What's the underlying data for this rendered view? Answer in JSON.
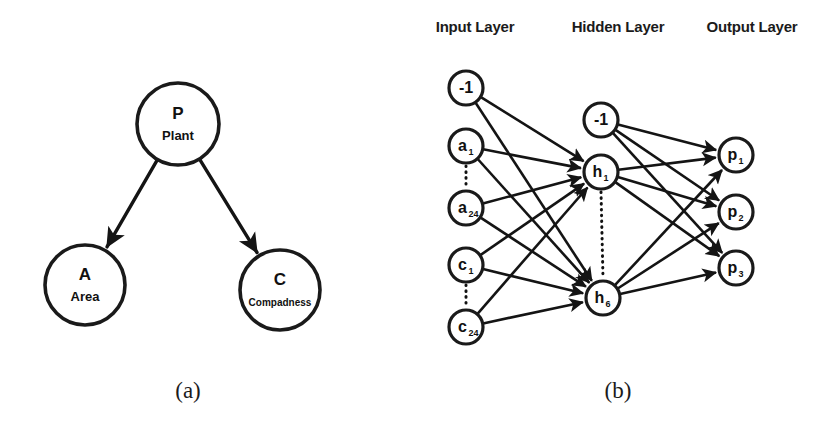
{
  "figure": {
    "background_color": "#ffffff",
    "ink_color": "#141414",
    "panels": [
      {
        "id": "panel-a",
        "caption": "(a)",
        "type": "bayesian-network-diagram",
        "nodes": [
          {
            "id": "P",
            "label": "P",
            "sublabel": "Plant",
            "cx": 178,
            "cy": 124,
            "r": 41
          },
          {
            "id": "A",
            "label": "A",
            "sublabel": "Area",
            "cx": 85,
            "cy": 285,
            "r": 40
          },
          {
            "id": "C",
            "label": "C",
            "sublabel": "Compadness",
            "cx": 280,
            "cy": 290,
            "r": 40
          }
        ],
        "edges": [
          {
            "from": "P",
            "to": "A",
            "arrow": true
          },
          {
            "from": "P",
            "to": "C",
            "arrow": true
          }
        ]
      },
      {
        "id": "panel-b",
        "caption": "(b)",
        "type": "neural-network-diagram",
        "layer_labels": [
          {
            "text": "Input Layer",
            "x": 475,
            "y": 32
          },
          {
            "text": "Hidden Layer",
            "x": 618,
            "y": 32
          },
          {
            "text": "Output Layer",
            "x": 752,
            "y": 32
          }
        ],
        "layers": [
          {
            "name": "input",
            "nodes": [
              {
                "id": "in-bias",
                "label": "-1",
                "sub": "",
                "cx": 466,
                "cy": 88,
                "r": 17
              },
              {
                "id": "a1",
                "label": "a",
                "sub": "1",
                "cx": 466,
                "cy": 146,
                "r": 17
              },
              {
                "id": "a24",
                "label": "a",
                "sub": "24",
                "cx": 466,
                "cy": 208,
                "r": 17
              },
              {
                "id": "c1",
                "label": "c",
                "sub": "1",
                "cx": 466,
                "cy": 265,
                "r": 17
              },
              {
                "id": "c24",
                "label": "c",
                "sub": "24",
                "cx": 466,
                "cy": 327,
                "r": 17
              }
            ],
            "ellipses": [
              {
                "from": "a1",
                "to": "a24"
              },
              {
                "from": "c1",
                "to": "c24"
              }
            ]
          },
          {
            "name": "hidden",
            "nodes": [
              {
                "id": "hid-bias",
                "label": "-1",
                "sub": "",
                "cx": 601,
                "cy": 120,
                "r": 17
              },
              {
                "id": "h1",
                "label": "h",
                "sub": "1",
                "cx": 601,
                "cy": 172,
                "r": 17
              },
              {
                "id": "h6",
                "label": "h",
                "sub": "6",
                "cx": 603,
                "cy": 298,
                "r": 17
              }
            ],
            "ellipses": [
              {
                "from": "h1",
                "to": "h6"
              }
            ]
          },
          {
            "name": "output",
            "nodes": [
              {
                "id": "p1",
                "label": "p",
                "sub": "1",
                "cx": 736,
                "cy": 155,
                "r": 17
              },
              {
                "id": "p2",
                "label": "p",
                "sub": "2",
                "cx": 736,
                "cy": 212,
                "r": 17
              },
              {
                "id": "p3",
                "label": "p",
                "sub": "3",
                "cx": 736,
                "cy": 268,
                "r": 17
              }
            ],
            "ellipses": []
          }
        ],
        "edges": [
          {
            "from": "in-bias",
            "to": "h1"
          },
          {
            "from": "in-bias",
            "to": "h6"
          },
          {
            "from": "a1",
            "to": "h1"
          },
          {
            "from": "a1",
            "to": "h6"
          },
          {
            "from": "a24",
            "to": "h1"
          },
          {
            "from": "a24",
            "to": "h6"
          },
          {
            "from": "c1",
            "to": "h1"
          },
          {
            "from": "c1",
            "to": "h6"
          },
          {
            "from": "c24",
            "to": "h1"
          },
          {
            "from": "c24",
            "to": "h6"
          },
          {
            "from": "hid-bias",
            "to": "p1"
          },
          {
            "from": "hid-bias",
            "to": "p2"
          },
          {
            "from": "hid-bias",
            "to": "p3"
          },
          {
            "from": "h1",
            "to": "p1"
          },
          {
            "from": "h1",
            "to": "p2"
          },
          {
            "from": "h1",
            "to": "p3"
          },
          {
            "from": "h6",
            "to": "p1"
          },
          {
            "from": "h6",
            "to": "p2"
          },
          {
            "from": "h6",
            "to": "p3"
          }
        ]
      }
    ],
    "captions": [
      {
        "text": "(a)",
        "x": 188,
        "y": 398
      },
      {
        "text": "(b)",
        "x": 618,
        "y": 398
      }
    ]
  }
}
